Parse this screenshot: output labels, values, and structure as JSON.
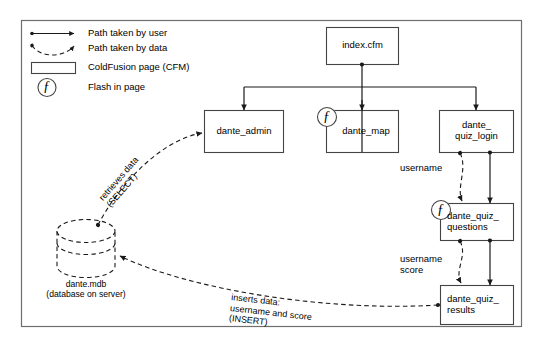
{
  "diagram": {
    "frame": {
      "stroke": "#555555"
    },
    "colors": {
      "line": "#1a1a1a",
      "box_stroke": "#444444",
      "frame_stroke": "#666666",
      "text": "#000000",
      "background": "#ffffff"
    },
    "legend": {
      "items": [
        {
          "key": "user-path",
          "icon": "solid-arrow-icon",
          "label": "Path taken by user"
        },
        {
          "key": "data-path",
          "icon": "dashed-arrow-icon",
          "label": "Path taken by data"
        },
        {
          "key": "cfm-page",
          "icon": "rectangle-icon",
          "label": "ColdFusion page (CFM)"
        },
        {
          "key": "flash",
          "icon": "flash-f-circle-icon",
          "label": "Flash in page"
        }
      ]
    },
    "nodes": [
      {
        "id": "index",
        "label": "index.cfm",
        "type": "cfm",
        "flash": false
      },
      {
        "id": "dante_admin",
        "label": "dante_admin",
        "type": "cfm",
        "flash": false
      },
      {
        "id": "dante_map",
        "label": "dante_map",
        "type": "cfm",
        "flash": true
      },
      {
        "id": "dante_quiz_login",
        "label": "dante_\nquiz_login",
        "type": "cfm",
        "flash": false
      },
      {
        "id": "dante_quiz_questions",
        "label": "dante_quiz_\nquestions",
        "type": "cfm",
        "flash": true
      },
      {
        "id": "dante_quiz_results",
        "label": "dante_quiz_\nresults",
        "type": "cfm",
        "flash": false
      }
    ],
    "database": {
      "id": "dante_mdb",
      "name": "dante.mdb",
      "subtitle": "(database on server)"
    },
    "edge_labels": {
      "select": "retrieves data\n(SELECT)",
      "insert": "inserts data:\nusername and score\n(INSERT)",
      "username": "username",
      "username_score": "username\nscore"
    },
    "flash_glyph": "ƒ"
  }
}
